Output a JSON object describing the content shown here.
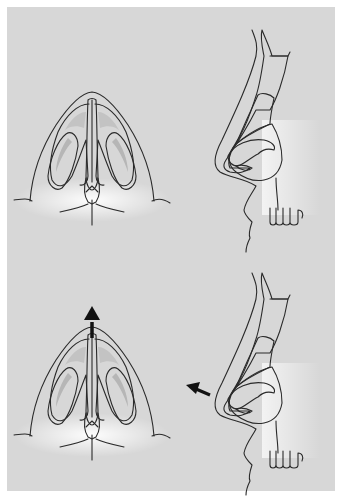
{
  "figure": {
    "type": "medical-illustration",
    "panels": [
      {
        "id": "top-basal",
        "view": "basal (worm's-eye) view of nose",
        "arrow": null
      },
      {
        "id": "top-lateral",
        "view": "lateral profile of nose with cartilages",
        "arrow": null
      },
      {
        "id": "bottom-basal",
        "view": "basal view after tip projection",
        "arrow": "up"
      },
      {
        "id": "bottom-lateral",
        "view": "lateral profile with tip projection",
        "arrow": "anterior-left"
      }
    ]
  },
  "colors": {
    "margin": "#ffffff",
    "background": "#d7d7d7",
    "skin": "#f2f2f2",
    "glow": "#ffffff",
    "cartilage_light": "#e6e6e6",
    "cartilage_mid": "#b9b9b9",
    "nostril_dark": "#8a8a8a",
    "nostril_inner": "#a9a9a9",
    "outline": "#2a2a2a",
    "arrow": "#111111"
  }
}
